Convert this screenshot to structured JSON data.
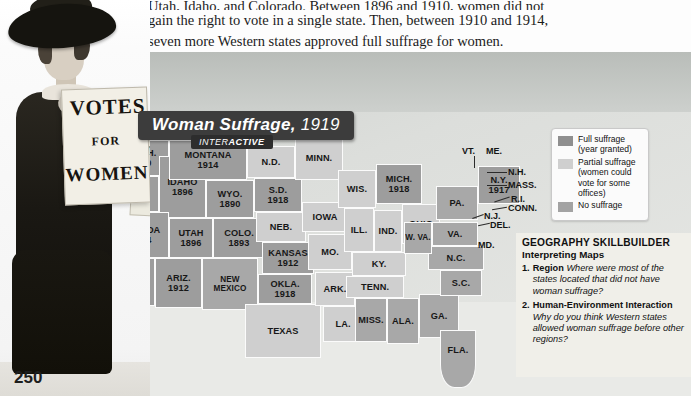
{
  "page": {
    "number": "250",
    "body_lines": [
      "Utah, Idaho, and Colorado. Between 1896 and 1910, women did not",
      "gain the right to vote in a single state. Then, between 1910 and 1914,",
      "seven more Western states approved full suffrage for women."
    ]
  },
  "photo": {
    "placard_line1": "VOTES",
    "placard_line2": "FOR",
    "placard_line3": "WOMEN",
    "placard2_text": "W C T"
  },
  "map": {
    "title_main": "Woman Suffrage,",
    "title_year": "1919",
    "interactive_prefix": "INTER",
    "interactive_suffix": "ACTIVE",
    "states": [
      {
        "name": "WASH.",
        "year": "1910",
        "status": "full"
      },
      {
        "name": "ORE.",
        "year": "1912",
        "status": "full"
      },
      {
        "name": "IDAHO",
        "year": "1896",
        "status": "full"
      },
      {
        "name": "MONTANA",
        "year": "1914",
        "status": "full"
      },
      {
        "name": "WYO.",
        "year": "1890",
        "status": "full"
      },
      {
        "name": "NEVADA",
        "year": "1914",
        "status": "full"
      },
      {
        "name": "UTAH",
        "year": "1896",
        "status": "full"
      },
      {
        "name": "CALIF.",
        "year": "1911",
        "status": "full"
      },
      {
        "name": "ARIZ.",
        "year": "1912",
        "status": "full"
      },
      {
        "name": "COLO.",
        "year": "1893",
        "status": "full"
      },
      {
        "name": "S.D.",
        "year": "1918",
        "status": "full"
      },
      {
        "name": "KANSAS",
        "year": "1912",
        "status": "full"
      },
      {
        "name": "OKLA.",
        "year": "1918",
        "status": "full"
      },
      {
        "name": "MICH.",
        "year": "1918",
        "status": "full"
      },
      {
        "name": "N.Y.",
        "year": "1917",
        "status": "full"
      },
      {
        "name": "NEW MEXICO",
        "year": "",
        "status": "none"
      },
      {
        "name": "N.D.",
        "year": "",
        "status": "partial"
      },
      {
        "name": "MINN.",
        "year": "",
        "status": "partial"
      },
      {
        "name": "NEB.",
        "year": "",
        "status": "partial"
      },
      {
        "name": "IOWA",
        "year": "",
        "status": "partial"
      },
      {
        "name": "MO.",
        "year": "",
        "status": "partial"
      },
      {
        "name": "ARK.",
        "year": "",
        "status": "partial"
      },
      {
        "name": "TEXAS",
        "year": "",
        "status": "partial"
      },
      {
        "name": "LA.",
        "year": "",
        "status": "partial"
      },
      {
        "name": "WIS.",
        "year": "",
        "status": "partial"
      },
      {
        "name": "ILL.",
        "year": "",
        "status": "partial"
      },
      {
        "name": "IND.",
        "year": "",
        "status": "partial"
      },
      {
        "name": "OHIO",
        "year": "",
        "status": "partial"
      },
      {
        "name": "KY.",
        "year": "",
        "status": "partial"
      },
      {
        "name": "TENN.",
        "year": "",
        "status": "partial"
      },
      {
        "name": "MISS.",
        "year": "",
        "status": "none"
      },
      {
        "name": "ALA.",
        "year": "",
        "status": "none"
      },
      {
        "name": "GA.",
        "year": "",
        "status": "none"
      },
      {
        "name": "FLA.",
        "year": "",
        "status": "none"
      },
      {
        "name": "S.C.",
        "year": "",
        "status": "none"
      },
      {
        "name": "N.C.",
        "year": "",
        "status": "none"
      },
      {
        "name": "VA.",
        "year": "",
        "status": "none"
      },
      {
        "name": "W. VA.",
        "year": "",
        "status": "none"
      },
      {
        "name": "PA.",
        "year": "",
        "status": "none"
      }
    ],
    "leader_labels": [
      "VT.",
      "ME.",
      "N.H.",
      "MASS.",
      "R.I.",
      "CONN.",
      "N.J.",
      "DEL.",
      "MD."
    ]
  },
  "legend": {
    "items": [
      {
        "label": "Full suffrage (year granted)",
        "line1": "Full suffrage",
        "line2": "(year granted)",
        "color": "#8f8f8f"
      },
      {
        "label": "Partial suffrage (women could vote for some offices)",
        "line1": "Partial suffrage",
        "line2": "(women could",
        "line3": "vote for some",
        "line4": "offices)",
        "color": "#cfcfcf"
      },
      {
        "label": "No suffrage",
        "line1": "No suffrage",
        "color": "#a3a3a3"
      }
    ]
  },
  "skillbuilder": {
    "heading": "GEOGRAPHY SKILLBUILDER",
    "subheading": "Interpreting Maps",
    "questions": [
      {
        "number": "1.",
        "topic": "Region",
        "text": "Where were most of the states located that did not have woman suffrage?"
      },
      {
        "number": "2.",
        "topic": "Human-Environment Interaction",
        "text": "Why do you think Western states allowed woman suffrage before other regions?"
      }
    ]
  }
}
